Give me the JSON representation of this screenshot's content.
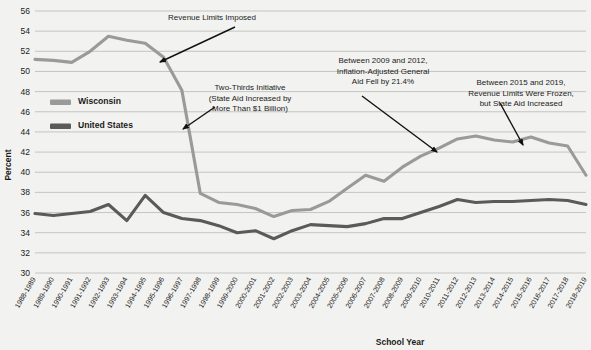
{
  "chart_data": {
    "type": "line",
    "title": "",
    "xlabel": "School Year",
    "ylabel": "Percent",
    "ylim": [
      30,
      56
    ],
    "ytick_step": 2,
    "grid": true,
    "legend_position": "inside-upper-left",
    "categories": [
      "1988-1989",
      "1989-1990",
      "1990-1991",
      "1991-1992",
      "1992-1993",
      "1993-1994",
      "1994-1995",
      "1995-1996",
      "1996-1997",
      "1997-1998",
      "1998-1999",
      "1999-2000",
      "2000-2001",
      "2001-2002",
      "2002-2003",
      "2003-2004",
      "2004-2005",
      "2005-2006",
      "2006-2007",
      "2007-2008",
      "2008-2009",
      "2009-2010",
      "2010-2011",
      "2011-2012",
      "2012-2013",
      "2013-2014",
      "2014-2015",
      "2015-2016",
      "2016-2017",
      "2017-2018",
      "2018-2019"
    ],
    "yticks": [
      30,
      32,
      34,
      36,
      38,
      40,
      42,
      44,
      46,
      48,
      50,
      52,
      54,
      56
    ],
    "series": [
      {
        "name": "Wisconsin",
        "color": "#9a9a98",
        "values": [
          51.2,
          51.1,
          50.9,
          52.0,
          53.5,
          53.1,
          52.8,
          51.4,
          48.1,
          37.9,
          37.0,
          36.8,
          36.4,
          35.6,
          36.2,
          36.3,
          37.1,
          38.4,
          39.7,
          39.1,
          40.5,
          41.6,
          42.4,
          43.3,
          43.6,
          43.2,
          43.0,
          43.5,
          42.9,
          42.6,
          39.7
        ]
      },
      {
        "name": "United States",
        "color": "#5a5a58",
        "values": [
          35.9,
          35.7,
          35.9,
          36.1,
          36.8,
          35.2,
          37.7,
          36.0,
          35.4,
          35.2,
          34.7,
          34.0,
          34.2,
          33.4,
          34.2,
          34.8,
          34.7,
          34.6,
          34.9,
          35.4,
          35.4,
          36.0,
          36.6,
          37.3,
          37.0,
          37.1,
          37.1,
          37.2,
          37.3,
          37.2,
          36.8
        ]
      }
    ],
    "annotations": [
      {
        "id": "revenue-limits",
        "lines": [
          "Revenue Limits Imposed"
        ],
        "text_x": 212,
        "text_y": 20,
        "arrow": {
          "x1": 235,
          "y1": 27,
          "x2": 160,
          "y2": 62
        }
      },
      {
        "id": "two-thirds",
        "lines": [
          "Two-Thirds Initiative",
          "(State Aid Increased by",
          "More Than $1 Billion)"
        ],
        "text_x": 250,
        "text_y": 90,
        "arrow": {
          "x1": 215,
          "y1": 107,
          "x2": 183,
          "y2": 129
        }
      },
      {
        "id": "inflation-adjusted",
        "lines": [
          "Between 2009 and 2012,",
          "Inflation-Adjusted General",
          "Aid Fell by 21.4%"
        ],
        "text_x": 383,
        "text_y": 63,
        "arrow": {
          "x1": 362,
          "y1": 96,
          "x2": 437,
          "y2": 152
        }
      },
      {
        "id": "revenue-limits-frozen",
        "lines": [
          "Between 2015 and 2019,",
          "Revenue Limits Were Frozen,",
          "but State Aid Increased"
        ],
        "text_x": 521,
        "text_y": 85,
        "arrow": {
          "x1": 500,
          "y1": 103,
          "x2": 523,
          "y2": 145
        }
      }
    ]
  },
  "legend": {
    "items": [
      {
        "label": "Wisconsin",
        "color": "#9a9a98"
      },
      {
        "label": "United States",
        "color": "#5a5a58"
      }
    ]
  },
  "axes": {
    "y_title": "Percent",
    "x_title": "School Year"
  }
}
